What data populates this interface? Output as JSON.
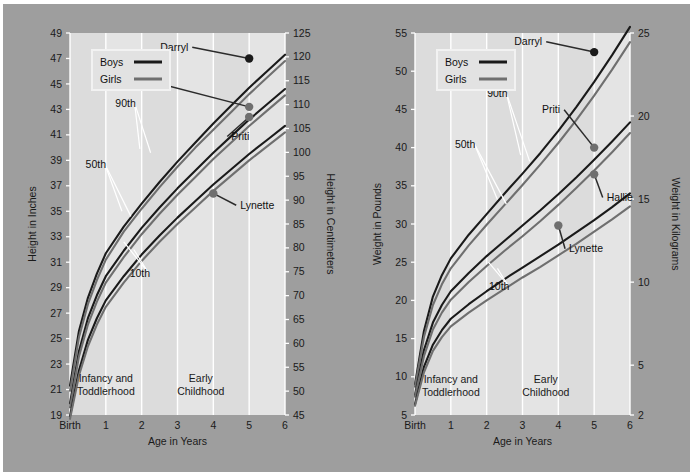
{
  "figure": {
    "background_outer": "#9e9e9e",
    "panel_background": "#e4e4e4",
    "band_shade": "#dcdcdc",
    "boys_color": "#1a1a1a",
    "girls_color": "#6f6f6f"
  },
  "charts": [
    {
      "id": "height-chart",
      "legend": {
        "boys": "Boys",
        "girls": "Girls"
      },
      "xlabel": "Age in Years",
      "ylabel_left": "Height in Inches",
      "ylabel_right": "Height in Centimeters",
      "xticks": [
        "Birth",
        "1",
        "2",
        "3",
        "4",
        "5",
        "6"
      ],
      "yticks_left": [
        "19",
        "21",
        "23",
        "25",
        "27",
        "29",
        "31",
        "33",
        "35",
        "37",
        "39",
        "41",
        "43",
        "45",
        "47",
        "49"
      ],
      "yticks_right": [
        "45",
        "50",
        "55",
        "60",
        "65",
        "70",
        "75",
        "80",
        "85",
        "90",
        "95",
        "100",
        "105",
        "110",
        "115",
        "120",
        "125"
      ],
      "bands": [
        {
          "label_line1": "Infancy and",
          "label_line2": "Toddlerhood"
        },
        {
          "label_line1": "Early",
          "label_line2": "Childhood"
        }
      ],
      "percentile_labels": [
        "90th",
        "50th",
        "10th"
      ],
      "points": [
        {
          "name": "Darryl",
          "sex": "boy",
          "age": 5.0,
          "value_in": 47.0
        },
        {
          "name": "Hallie",
          "sex": "girl",
          "age": 5.0,
          "value_in": 43.2
        },
        {
          "name": "Priti",
          "sex": "girl",
          "age": 5.0,
          "value_in": 42.4
        },
        {
          "name": "Lynette",
          "sex": "girl",
          "age": 4.0,
          "value_in": 36.4
        }
      ],
      "chart_data": {
        "type": "line",
        "title": "Height for age",
        "xlabel": "Age in Years",
        "ylabel": "Height in Inches",
        "ylabel_secondary": "Height in Centimeters",
        "xlim": [
          0,
          6
        ],
        "ylim": [
          19,
          49
        ],
        "ylim_secondary": [
          45,
          125
        ],
        "grid": true,
        "legend": [
          "Boys",
          "Girls"
        ],
        "x": [
          0,
          0.25,
          0.5,
          0.75,
          1,
          1.5,
          2,
          2.5,
          3,
          3.5,
          4,
          4.5,
          5,
          5.5,
          6
        ],
        "series": [
          {
            "name": "Boys 90th",
            "sex": "boy",
            "percentile": 90,
            "values": [
              21.3,
              25.6,
              28.2,
              30.1,
              31.7,
              33.8,
              35.6,
              37.3,
              38.9,
              40.4,
              41.9,
              43.3,
              44.7,
              46.0,
              47.3
            ]
          },
          {
            "name": "Girls 90th",
            "sex": "girl",
            "percentile": 90,
            "values": [
              20.9,
              25.1,
              27.7,
              29.6,
              31.2,
              33.4,
              35.2,
              36.9,
              38.5,
              40.0,
              41.4,
              42.8,
              44.2,
              45.5,
              46.8
            ]
          },
          {
            "name": "Boys 50th",
            "sex": "boy",
            "percentile": 50,
            "values": [
              19.9,
              24.0,
              26.6,
              28.4,
              29.9,
              31.9,
              33.7,
              35.3,
              36.8,
              38.2,
              39.6,
              40.9,
              42.2,
              43.4,
              44.6
            ]
          },
          {
            "name": "Girls 50th",
            "sex": "girl",
            "percentile": 50,
            "values": [
              19.6,
              23.6,
              26.1,
              27.9,
              29.4,
              31.4,
              33.2,
              34.8,
              36.3,
              37.7,
              39.1,
              40.4,
              41.7,
              42.9,
              44.1
            ]
          },
          {
            "name": "Boys 10th",
            "sex": "boy",
            "percentile": 10,
            "values": [
              18.9,
              22.5,
              24.9,
              26.6,
              28.0,
              29.9,
              31.6,
              33.1,
              34.5,
              35.8,
              37.1,
              38.3,
              39.5,
              40.6,
              41.7
            ]
          },
          {
            "name": "Girls 10th",
            "sex": "girl",
            "percentile": 10,
            "values": [
              18.7,
              22.1,
              24.4,
              26.1,
              27.5,
              29.4,
              31.1,
              32.6,
              34.0,
              35.3,
              36.6,
              37.8,
              39.0,
              40.1,
              41.2
            ]
          }
        ],
        "annotations": [
          {
            "text": "Darryl",
            "x": 5.0,
            "y": 47.0
          },
          {
            "text": "Hallie",
            "x": 5.0,
            "y": 43.2
          },
          {
            "text": "Priti",
            "x": 5.0,
            "y": 42.4
          },
          {
            "text": "Lynette",
            "x": 4.0,
            "y": 36.4
          },
          {
            "text": "90th"
          },
          {
            "text": "50th"
          },
          {
            "text": "10th"
          },
          {
            "text": "Infancy and Toddlerhood"
          },
          {
            "text": "Early Childhood"
          }
        ]
      }
    },
    {
      "id": "weight-chart",
      "legend": {
        "boys": "Boys",
        "girls": "Girls"
      },
      "xlabel": "Age in Years",
      "ylabel_left": "Weight in Pounds",
      "ylabel_right": "Weight in Kilograms",
      "xticks": [
        "Birth",
        "1",
        "2",
        "3",
        "4",
        "5",
        "6"
      ],
      "yticks_left": [
        "5",
        "10",
        "15",
        "20",
        "25",
        "30",
        "35",
        "40",
        "45",
        "50",
        "55"
      ],
      "yticks_right": [
        "2",
        "5",
        "10",
        "15",
        "20",
        "25"
      ],
      "bands": [
        {
          "label_line1": "Infancy and",
          "label_line2": "Toddlerhood"
        },
        {
          "label_line1": "Early",
          "label_line2": "Childhood"
        }
      ],
      "percentile_labels": [
        "90th",
        "50th",
        "10th"
      ],
      "points": [
        {
          "name": "Darryl",
          "sex": "boy",
          "age": 5.0,
          "value_lb": 52.5
        },
        {
          "name": "Priti",
          "sex": "girl",
          "age": 5.0,
          "value_lb": 40.0
        },
        {
          "name": "Hallie",
          "sex": "girl",
          "age": 5.0,
          "value_lb": 36.5
        },
        {
          "name": "Lynette",
          "sex": "girl",
          "age": 4.0,
          "value_lb": 29.8
        }
      ],
      "chart_data": {
        "type": "line",
        "title": "Weight for age",
        "xlabel": "Age in Years",
        "ylabel": "Weight in Pounds",
        "ylabel_secondary": "Weight in Kilograms",
        "xlim": [
          0,
          6
        ],
        "ylim": [
          5,
          55
        ],
        "ylim_secondary": [
          2,
          25
        ],
        "grid": true,
        "legend": [
          "Boys",
          "Girls"
        ],
        "x": [
          0,
          0.25,
          0.5,
          0.75,
          1,
          1.5,
          2,
          2.5,
          3,
          3.5,
          4,
          4.5,
          5,
          5.5,
          6
        ],
        "series": [
          {
            "name": "Boys 90th",
            "sex": "boy",
            "percentile": 90,
            "values": [
              9.0,
              16.0,
              20.5,
              23.3,
              25.5,
              28.6,
              31.3,
              34.0,
              36.6,
              39.3,
              42.2,
              45.3,
              48.6,
              52.1,
              55.8
            ]
          },
          {
            "name": "Girls 90th",
            "sex": "girl",
            "percentile": 90,
            "values": [
              8.7,
              15.2,
              19.4,
              22.1,
              24.2,
              27.2,
              29.9,
              32.5,
              35.1,
              37.8,
              40.6,
              43.6,
              46.8,
              50.2,
              53.8
            ]
          },
          {
            "name": "Boys 50th",
            "sex": "boy",
            "percentile": 50,
            "values": [
              7.6,
              13.5,
              17.1,
              19.4,
              21.2,
              23.6,
              25.8,
              27.8,
              29.8,
              31.8,
              33.9,
              36.1,
              38.4,
              40.8,
              43.3
            ]
          },
          {
            "name": "Girls 50th",
            "sex": "girl",
            "percentile": 50,
            "values": [
              7.4,
              12.7,
              16.2,
              18.4,
              20.1,
              22.4,
              24.5,
              26.5,
              28.4,
              30.4,
              32.5,
              34.7,
              37.0,
              39.4,
              41.9
            ]
          },
          {
            "name": "Boys 10th",
            "sex": "boy",
            "percentile": 10,
            "values": [
              6.4,
              11.3,
              14.2,
              16.1,
              17.6,
              19.5,
              21.2,
              22.8,
              24.3,
              25.8,
              27.3,
              28.9,
              30.5,
              32.2,
              34.0
            ]
          },
          {
            "name": "Girls 10th",
            "sex": "girl",
            "percentile": 10,
            "values": [
              6.2,
              10.6,
              13.4,
              15.2,
              16.6,
              18.4,
              20.0,
              21.5,
              23.0,
              24.4,
              25.9,
              27.4,
              29.0,
              30.6,
              32.3
            ]
          }
        ],
        "annotations": [
          {
            "text": "Darryl",
            "x": 5.0,
            "y": 52.5
          },
          {
            "text": "Priti",
            "x": 5.0,
            "y": 40.0
          },
          {
            "text": "Hallie",
            "x": 5.0,
            "y": 36.5
          },
          {
            "text": "Lynette",
            "x": 4.0,
            "y": 29.8
          },
          {
            "text": "90th"
          },
          {
            "text": "50th"
          },
          {
            "text": "10th"
          },
          {
            "text": "Infancy and Toddlerhood"
          },
          {
            "text": "Early Childhood"
          }
        ]
      }
    }
  ]
}
